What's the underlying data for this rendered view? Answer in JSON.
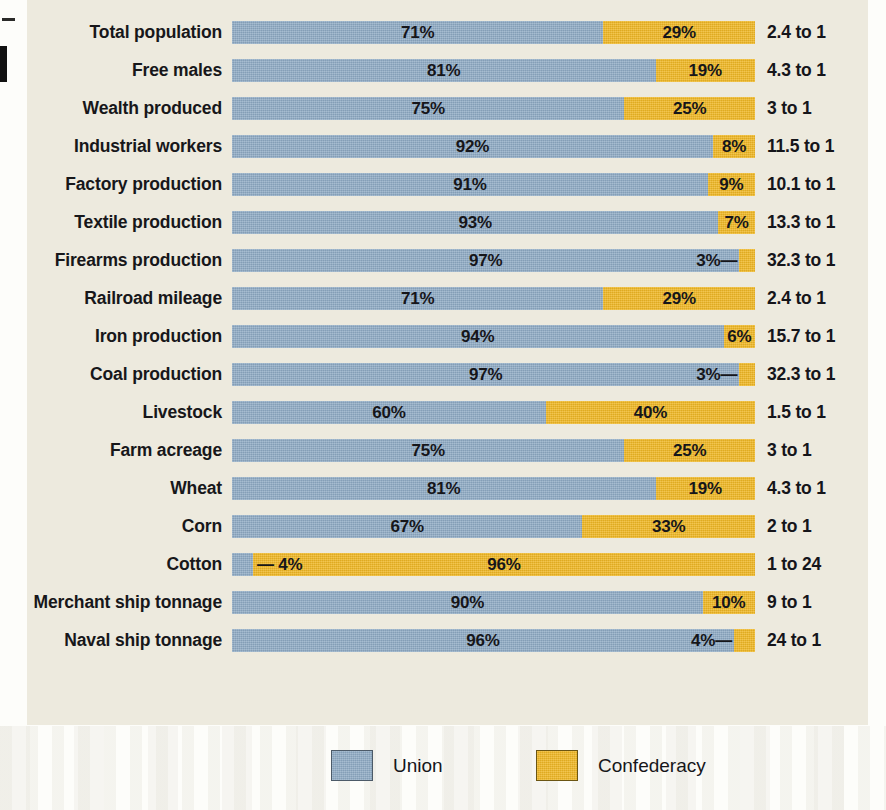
{
  "colors": {
    "union": "#8da9c3",
    "confederacy": "#efb723",
    "panel_background": "#edeade",
    "page_background": "#fdfdfa",
    "text": "#16161a"
  },
  "legend": {
    "items": [
      {
        "label": "Union",
        "swatch": "union-swatch",
        "color": "#8da9c3"
      },
      {
        "label": "Confederacy",
        "swatch": "confederacy-swatch",
        "color": "#efb723"
      }
    ]
  },
  "chart_data": {
    "type": "bar",
    "subtype": "100% stacked horizontal bar",
    "title": "",
    "xlabel": "",
    "ylabel": "",
    "xlim": [
      0,
      100
    ],
    "grid": false,
    "legend_position": "bottom-center",
    "categories": [
      "Total population",
      "Free males",
      "Wealth produced",
      "Industrial workers",
      "Factory production",
      "Textile production",
      "Firearms production",
      "Railroad mileage",
      "Iron production",
      "Coal production",
      "Livestock",
      "Farm acreage",
      "Wheat",
      "Corn",
      "Cotton",
      "Merchant ship tonnage",
      "Naval ship tonnage"
    ],
    "series": [
      {
        "name": "Union",
        "color": "#8da9c3",
        "values": [
          71,
          81,
          75,
          92,
          91,
          93,
          97,
          71,
          94,
          97,
          60,
          75,
          81,
          67,
          4,
          90,
          96
        ]
      },
      {
        "name": "Confederacy",
        "color": "#efb723",
        "values": [
          29,
          19,
          25,
          8,
          9,
          7,
          3,
          29,
          6,
          3,
          40,
          25,
          19,
          33,
          96,
          10,
          4
        ]
      }
    ],
    "ratios": [
      "2.4 to 1",
      "4.3 to 1",
      "3 to 1",
      "11.5 to 1",
      "10.1 to 1",
      "13.3 to 1",
      "32.3 to 1",
      "2.4 to 1",
      "15.7 to 1",
      "32.3 to 1",
      "1.5 to 1",
      "3 to 1",
      "4.3 to 1",
      "2 to 1",
      "1 to 24",
      "9 to 1",
      "24 to 1"
    ],
    "rows": [
      {
        "label": "Total population",
        "union": 71,
        "confederacy": 29,
        "union_text": "71%",
        "confederacy_text": "29%",
        "ratio": "2.4 to 1",
        "union_label_inside": true,
        "confederacy_label_inside": true,
        "leader": "none"
      },
      {
        "label": "Free males",
        "union": 81,
        "confederacy": 19,
        "union_text": "81%",
        "confederacy_text": "19%",
        "ratio": "4.3 to 1",
        "union_label_inside": true,
        "confederacy_label_inside": true,
        "leader": "none"
      },
      {
        "label": "Wealth produced",
        "union": 75,
        "confederacy": 25,
        "union_text": "75%",
        "confederacy_text": "25%",
        "ratio": "3 to 1",
        "union_label_inside": true,
        "confederacy_label_inside": true,
        "leader": "none"
      },
      {
        "label": "Industrial workers",
        "union": 92,
        "confederacy": 8,
        "union_text": "92%",
        "confederacy_text": "8%",
        "ratio": "11.5 to 1",
        "union_label_inside": true,
        "confederacy_label_inside": true,
        "leader": "none"
      },
      {
        "label": "Factory production",
        "union": 91,
        "confederacy": 9,
        "union_text": "91%",
        "confederacy_text": "9%",
        "ratio": "10.1 to 1",
        "union_label_inside": true,
        "confederacy_label_inside": true,
        "leader": "none"
      },
      {
        "label": "Textile production",
        "union": 93,
        "confederacy": 7,
        "union_text": "93%",
        "confederacy_text": "7%",
        "ratio": "13.3 to 1",
        "union_label_inside": true,
        "confederacy_label_inside": true,
        "leader": "none"
      },
      {
        "label": "Firearms production",
        "union": 97,
        "confederacy": 3,
        "union_text": "97%",
        "confederacy_text": "3%—",
        "ratio": "32.3 to 1",
        "union_label_inside": true,
        "confederacy_label_inside": false,
        "leader": "right"
      },
      {
        "label": "Railroad mileage",
        "union": 71,
        "confederacy": 29,
        "union_text": "71%",
        "confederacy_text": "29%",
        "ratio": "2.4 to 1",
        "union_label_inside": true,
        "confederacy_label_inside": true,
        "leader": "none"
      },
      {
        "label": "Iron production",
        "union": 94,
        "confederacy": 6,
        "union_text": "94%",
        "confederacy_text": "6%",
        "ratio": "15.7 to 1",
        "union_label_inside": true,
        "confederacy_label_inside": true,
        "leader": "none"
      },
      {
        "label": "Coal production",
        "union": 97,
        "confederacy": 3,
        "union_text": "97%",
        "confederacy_text": "3%—",
        "ratio": "32.3 to 1",
        "union_label_inside": true,
        "confederacy_label_inside": false,
        "leader": "right"
      },
      {
        "label": "Livestock",
        "union": 60,
        "confederacy": 40,
        "union_text": "60%",
        "confederacy_text": "40%",
        "ratio": "1.5 to 1",
        "union_label_inside": true,
        "confederacy_label_inside": true,
        "leader": "none"
      },
      {
        "label": "Farm acreage",
        "union": 75,
        "confederacy": 25,
        "union_text": "75%",
        "confederacy_text": "25%",
        "ratio": "3 to 1",
        "union_label_inside": true,
        "confederacy_label_inside": true,
        "leader": "none"
      },
      {
        "label": "Wheat",
        "union": 81,
        "confederacy": 19,
        "union_text": "81%",
        "confederacy_text": "19%",
        "ratio": "4.3 to 1",
        "union_label_inside": true,
        "confederacy_label_inside": true,
        "leader": "none"
      },
      {
        "label": "Corn",
        "union": 67,
        "confederacy": 33,
        "union_text": "67%",
        "confederacy_text": "33%",
        "ratio": "2 to 1",
        "union_label_inside": true,
        "confederacy_label_inside": true,
        "leader": "none"
      },
      {
        "label": "Cotton",
        "union": 4,
        "confederacy": 96,
        "union_text": "— 4%",
        "confederacy_text": "96%",
        "ratio": "1 to 24",
        "union_label_inside": false,
        "confederacy_label_inside": true,
        "leader": "left"
      },
      {
        "label": "Merchant ship tonnage",
        "union": 90,
        "confederacy": 10,
        "union_text": "90%",
        "confederacy_text": "10%",
        "ratio": "9 to 1",
        "union_label_inside": true,
        "confederacy_label_inside": true,
        "leader": "none"
      },
      {
        "label": "Naval ship tonnage",
        "union": 96,
        "confederacy": 4,
        "union_text": "96%",
        "confederacy_text": "4%—",
        "ratio": "24 to 1",
        "union_label_inside": true,
        "confederacy_label_inside": false,
        "leader": "right"
      }
    ]
  }
}
